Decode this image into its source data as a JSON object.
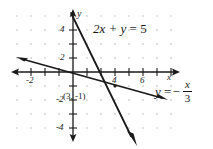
{
  "figure": {
    "type": "coordinate-graph",
    "axis_labels": {
      "x": "x",
      "y": "y"
    },
    "x_ticks": [
      {
        "value": -2,
        "label": "-2"
      },
      {
        "value": 4,
        "label": "4"
      },
      {
        "value": 6,
        "label": "6"
      }
    ],
    "y_ticks": [
      {
        "value": 4,
        "label": "4"
      },
      {
        "value": 2,
        "label": "2"
      },
      {
        "value": -2,
        "label": "-2"
      },
      {
        "value": -4,
        "label": "-4"
      }
    ],
    "x_range": [
      -4.3,
      7.5
    ],
    "y_range": [
      -4.4,
      4.4
    ],
    "grid": "dots",
    "lines": [
      {
        "name": "line-2x-plus-y-equals-5",
        "label": "2x + y = 5",
        "equation_parts": {
          "lhs": "2x + y",
          "rel": "=",
          "rhs": "5"
        },
        "slope": -2,
        "intercept": 5
      },
      {
        "name": "line-y-equals-negative-x-over-3",
        "label": "y = -x/3",
        "equation_parts": {
          "lhs": "y",
          "rel": "=",
          "minus": "−",
          "numerator": "x",
          "denominator": "3"
        },
        "slope": -0.3333,
        "intercept": 0
      }
    ],
    "points": [
      {
        "name": "intersection-point",
        "label": "(3, -1)",
        "x": 3,
        "y": -1
      }
    ],
    "colors": {
      "ink": "#1a1a1a",
      "grid_dot": "#b9b9b9",
      "background": "#ffffff"
    }
  }
}
